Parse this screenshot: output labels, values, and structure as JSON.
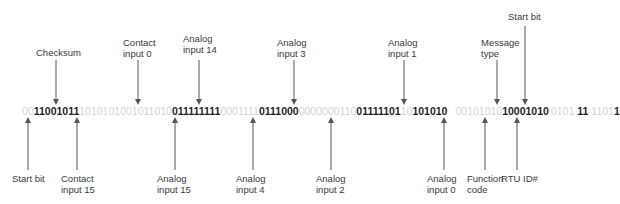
{
  "diagram": {
    "bitstream": [
      {
        "bits": "00",
        "emphasis": false
      },
      {
        "bits": "11001011",
        "emphasis": true
      },
      {
        "bits": "1010101001011010",
        "emphasis": false
      },
      {
        "bits": "011111111",
        "emphasis": true
      },
      {
        "bits": "0001111",
        "emphasis": false
      },
      {
        "bits": "0111000",
        "emphasis": true
      },
      {
        "bits": "0000000110",
        "emphasis": false
      },
      {
        "bits": "01111101",
        "emphasis": true
      },
      {
        "bits": "10",
        "emphasis": false
      },
      {
        "bits": "101010",
        "emphasis": true
      },
      {
        "bits": "00101010",
        "emphasis": false
      },
      {
        "bits": "10001010",
        "emphasis": true
      },
      {
        "bits": "0101",
        "emphasis": false
      },
      {
        "bits": "11",
        "emphasis": true
      },
      {
        "bits": "1101",
        "emphasis": false
      },
      {
        "bits": "1",
        "emphasis": true
      }
    ],
    "top_labels": [
      {
        "text": "Checksum"
      },
      {
        "text": "Contact\ninput 0"
      },
      {
        "text": "Analog\ninput 14"
      },
      {
        "text": "Analog\ninput 3"
      },
      {
        "text": "Analog\ninput 1"
      },
      {
        "text": "Message\ntype"
      },
      {
        "text": "Start bit"
      }
    ],
    "bottom_labels": [
      {
        "text": "Start bit"
      },
      {
        "text": "Contact\ninput 15"
      },
      {
        "text": "Analog\ninput 15"
      },
      {
        "text": "Analog\ninput 4"
      },
      {
        "text": "Analog\ninput 2"
      },
      {
        "text": "Analog\ninput 0"
      },
      {
        "text": "Function\ncode"
      },
      {
        "text": "RTU ID#"
      }
    ],
    "colors": {
      "emphasized_bits": "#1e1e1e",
      "dimmed_bits": "#d4d4d4",
      "arrows": "#555555",
      "labels": "#3a3a3a"
    }
  }
}
